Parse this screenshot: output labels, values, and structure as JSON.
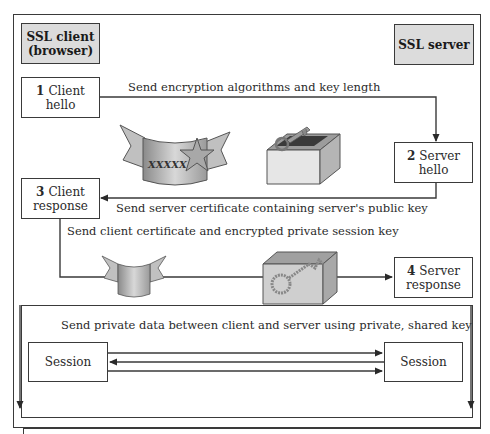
{
  "header": {
    "client_title": "SSL client (browser)",
    "client_title_line1": "SSL client",
    "client_title_line2": "(browser)",
    "server_title": "SSL server"
  },
  "steps": [
    {
      "num": "1",
      "line1": "Client",
      "line2": "hello"
    },
    {
      "num": "2",
      "line1": "Server",
      "line2": "hello"
    },
    {
      "num": "3",
      "line1": "Client",
      "line2": "response"
    },
    {
      "num": "4",
      "line1": "Server",
      "line2": "response"
    }
  ],
  "messages": {
    "m1": "Send encryption algorithms and key length",
    "m2": "Send server certificate containing server's public key",
    "m3": "Send client certificate and encrypted private session key",
    "m4": "Send private data between client and server using private, shared key"
  },
  "session": {
    "left_label": "Session",
    "right_label": "Session"
  },
  "icons": {
    "certificate_with_star": "server-certificate-icon",
    "open_box_with_key": "public-key-box-icon",
    "small_certificate": "client-certificate-icon",
    "closed_box_with_key": "encrypted-session-key-icon",
    "certificate_text": "XXXXX"
  },
  "colors": {
    "line": "#3a3a3a",
    "header_fill": "#dcdcdc",
    "icon_gray": "#b8b8b8"
  }
}
